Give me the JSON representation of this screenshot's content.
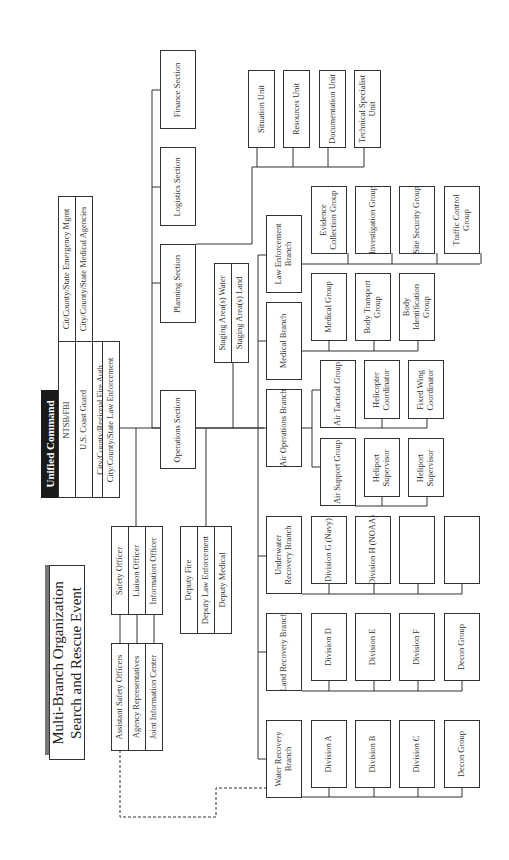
{
  "title": {
    "line1": "Multi-Branch Organization",
    "line2": "Search and Rescue Event"
  },
  "unified_command": {
    "header": "Unified Command",
    "members": [
      "NTSB/FBI",
      "U.S. Coast Guard",
      "City/County/Regional Fire Auth",
      "City/County/State Law Enforcement"
    ],
    "extra_members": [
      "Cit/County/State Emergency Mgmt",
      "City/County/State Medical Agencies"
    ]
  },
  "command_staff": {
    "officers": [
      "Safety Officer",
      "Liaison Officer",
      "Information Officer"
    ],
    "assistants": [
      "Assistant Safety Officers",
      "Agency Representatives",
      "Joint Information Center"
    ]
  },
  "deputies": [
    "Deputy Fire",
    "Deputy Law Enforcement",
    "Deputy Medical"
  ],
  "sections": {
    "operations": "Operations Section",
    "planning": "Planning Section",
    "logistics": "Logistics Section",
    "finance": "Finance Section"
  },
  "planning_units": [
    "Situation Unit",
    "Resources Unit",
    "Documentation Unit",
    "Technical Specialist Unit"
  ],
  "staging_areas": [
    "Staging Area(s) Water",
    "Staging Area(s) Land"
  ],
  "branches": {
    "law_enforcement": {
      "label": "Law Enforcement Branch",
      "groups": [
        "Evidence Collection Group",
        "Investigation Group",
        "Site Security Group",
        "Traffic Control Group"
      ]
    },
    "medical": {
      "label": "Medical Branch",
      "groups": [
        "Medical Group",
        "Body Transport Group",
        "Body Identification Group"
      ]
    },
    "air_operations": {
      "label": "Air Operations Branch",
      "tactical": {
        "label": "Air Tactical Group",
        "subs": [
          "Helicopter Coordinator",
          "Fixed Wing Coordinator"
        ]
      },
      "support": {
        "label": "Air Support Group",
        "subs": [
          "Heliport Supervisor",
          "Heliport Supervisor"
        ]
      }
    },
    "underwater_recovery": {
      "label": "Underwater Recovery Branch",
      "groups": [
        "Division G (Navy)",
        "Division H (NOAA)",
        "",
        ""
      ]
    },
    "land_recovery": {
      "label": "Land Recovery Branch",
      "groups": [
        "Division D",
        "Division E",
        "Division F",
        "Decon Group"
      ]
    },
    "water_recovery": {
      "label": "Water Recovery Branch",
      "groups": [
        "Division A",
        "Division B",
        "Division C",
        "Decon Group"
      ]
    }
  }
}
